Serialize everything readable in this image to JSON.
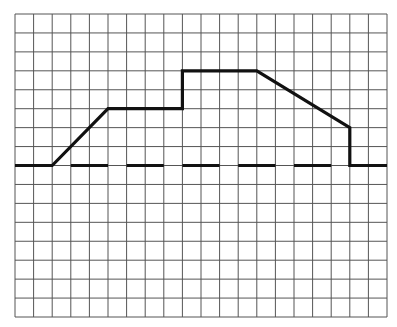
{
  "chart_data": {
    "type": "line",
    "title": "",
    "xlabel": "",
    "ylabel": "",
    "grid": true,
    "grid_columns": 20,
    "grid_rows": 16,
    "baseline_row": 8,
    "x": [
      0,
      2,
      5,
      9,
      9,
      13,
      18,
      18,
      20
    ],
    "values": [
      0,
      0,
      3,
      3,
      5,
      5,
      2,
      0,
      0
    ],
    "xlim": [
      0,
      20
    ],
    "ylim": [
      -8,
      8
    ],
    "baseline": {
      "style": "dashed",
      "y": 0,
      "dashes": [
        [
          3,
          5
        ],
        [
          6,
          8
        ],
        [
          9,
          11
        ],
        [
          12,
          14
        ],
        [
          15,
          17
        ]
      ]
    },
    "series": [
      {
        "name": "profile",
        "x": [
          0,
          2,
          5,
          9,
          9,
          13,
          18,
          18,
          20
        ],
        "values": [
          0,
          0,
          3,
          3,
          5,
          5,
          2,
          0,
          0
        ]
      }
    ]
  },
  "style": {
    "grid_color": "#555555",
    "line_color": "#111111",
    "background": "#ffffff"
  },
  "layout": {
    "left": 15,
    "top": 14,
    "right": 387,
    "bottom": 317
  }
}
